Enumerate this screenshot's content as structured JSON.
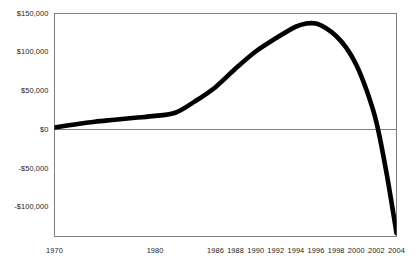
{
  "chart_data": {
    "type": "line",
    "title": "",
    "subtitle": "",
    "xlabel": "",
    "ylabel": "",
    "grid": false,
    "legend": null,
    "line_color": "#000000",
    "frame_color": "#808080",
    "zero_line_color": "#808080",
    "background": "#ffffff",
    "xlim": [
      1970,
      2004
    ],
    "ylim": [
      -137500,
      150000
    ],
    "ytick_values": [
      150000,
      100000,
      50000,
      0,
      -50000,
      -100000
    ],
    "ytick_labels": [
      "$150,000",
      "$100,000",
      "$50,000",
      "$0",
      "-$50,000",
      "-$100,000"
    ],
    "xtick_values": [
      1970,
      1980,
      1986,
      1988,
      1990,
      1992,
      1994,
      1996,
      1998,
      2000,
      2002,
      2004
    ],
    "xtick_labels": [
      "1970",
      "1980",
      "1986",
      "1988",
      "1990",
      "1992",
      "1994",
      "1996",
      "1998",
      "2000",
      "2002",
      "2004"
    ],
    "x": [
      1970,
      1972,
      1974,
      1976,
      1978,
      1980,
      1982,
      1984,
      1986,
      1988,
      1990,
      1992,
      1994,
      1995,
      1996,
      1997,
      1998,
      1999,
      2000,
      2001,
      2002,
      2003,
      2004
    ],
    "values": [
      3000,
      7000,
      10500,
      13000,
      15500,
      18000,
      22000,
      37000,
      55000,
      79000,
      101000,
      118000,
      133000,
      137000,
      137000,
      131000,
      121000,
      106000,
      84000,
      52000,
      10000,
      -55000,
      -133000
    ],
    "series": [
      {
        "name": "balance",
        "values": [
          3000,
          7000,
          10500,
          13000,
          15500,
          18000,
          22000,
          37000,
          55000,
          79000,
          101000,
          118000,
          133000,
          137000,
          137000,
          131000,
          121000,
          106000,
          84000,
          52000,
          10000,
          -55000,
          -133000
        ]
      }
    ],
    "annotations": []
  }
}
